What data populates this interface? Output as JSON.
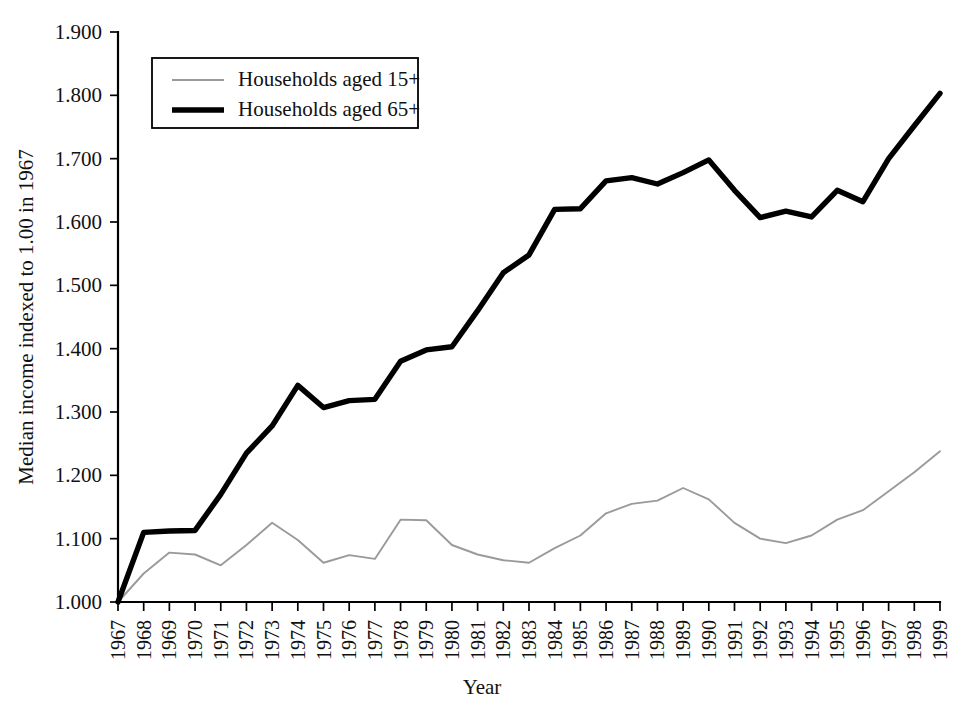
{
  "chart_data": {
    "type": "line",
    "title": "",
    "xlabel": "Year",
    "ylabel": "Median income indexed to 1.00 in 1967",
    "xlim": [
      1967,
      1999
    ],
    "ylim": [
      1.0,
      1.9
    ],
    "ytick_labels": [
      "1.900",
      "1.800",
      "1.700",
      "1.600",
      "1.500",
      "1.400",
      "1.300",
      "1.200",
      "1.100",
      "1.000"
    ],
    "ytick_values": [
      1.9,
      1.8,
      1.7,
      1.6,
      1.5,
      1.4,
      1.3,
      1.2,
      1.1,
      1.0
    ],
    "grid": false,
    "legend_position": "upper-left-inside",
    "categories": [
      1967,
      1968,
      1969,
      1970,
      1971,
      1972,
      1973,
      1974,
      1975,
      1976,
      1977,
      1978,
      1979,
      1980,
      1981,
      1982,
      1983,
      1984,
      1985,
      1986,
      1987,
      1988,
      1989,
      1990,
      1991,
      1992,
      1993,
      1994,
      1995,
      1996,
      1997,
      1998,
      1999
    ],
    "x": [
      "1967",
      "1968",
      "1969",
      "1970",
      "1971",
      "1972",
      "1973",
      "1974",
      "1975",
      "1976",
      "1977",
      "1978",
      "1979",
      "1980",
      "1981",
      "1982",
      "1983",
      "1984",
      "1985",
      "1986",
      "1987",
      "1988",
      "1989",
      "1990",
      "1991",
      "1992",
      "1993",
      "1994",
      "1995",
      "1996",
      "1997",
      "1998",
      "1999"
    ],
    "series": [
      {
        "name": "Households aged 15+",
        "style": "thin-gray",
        "color": "#9a9a9a",
        "values": [
          1.0,
          1.045,
          1.078,
          1.075,
          1.058,
          1.09,
          1.125,
          1.098,
          1.062,
          1.074,
          1.068,
          1.13,
          1.129,
          1.09,
          1.075,
          1.066,
          1.062,
          1.085,
          1.105,
          1.14,
          1.155,
          1.16,
          1.18,
          1.162,
          1.125,
          1.1,
          1.093,
          1.105,
          1.13,
          1.145,
          1.175,
          1.205,
          1.238
        ]
      },
      {
        "name": "Households aged 65+",
        "style": "thick-black",
        "color": "#000000",
        "values": [
          1.0,
          1.11,
          1.112,
          1.113,
          1.17,
          1.235,
          1.278,
          1.342,
          1.307,
          1.318,
          1.32,
          1.38,
          1.398,
          1.403,
          1.46,
          1.52,
          1.548,
          1.62,
          1.621,
          1.665,
          1.67,
          1.66,
          1.678,
          1.698,
          1.65,
          1.607,
          1.617,
          1.608,
          1.65,
          1.632,
          1.7,
          1.752,
          1.803
        ]
      }
    ]
  },
  "legend": {
    "entries": [
      {
        "label": "Households aged 15+",
        "swatch": "thin-line-swatch"
      },
      {
        "label": "Households aged 65+",
        "swatch": "thick-line-swatch"
      }
    ]
  },
  "axes": {
    "y_title": "Median income indexed to 1.00 in 1967",
    "x_title": "Year"
  }
}
